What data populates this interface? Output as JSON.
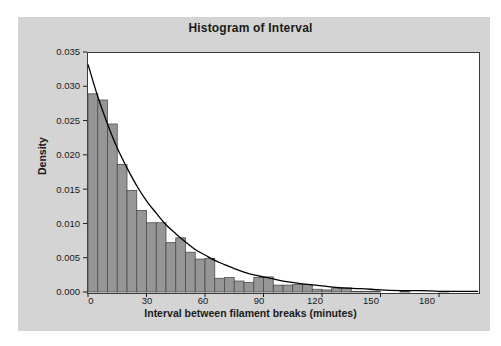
{
  "chart_data": {
    "type": "bar",
    "title": "Histogram of Interval",
    "xlabel": "Interval between filament breaks (minutes)",
    "ylabel": "Density",
    "xlim": [
      0,
      200
    ],
    "ylim": [
      0,
      0.035
    ],
    "grid": false,
    "legend": null,
    "bin_width": 5,
    "bar_color": "#969696",
    "bar_edge_color": "#4d4d4d",
    "curve_color": "#000000",
    "panel_color": "#d4d4d4",
    "plot_background": "#ffffff",
    "xticks": [
      0,
      30,
      60,
      90,
      120,
      150,
      180
    ],
    "xtick_labels": [
      "0",
      "30",
      "60",
      "90",
      "120",
      "150",
      "180"
    ],
    "yticks": [
      0.0,
      0.005,
      0.01,
      0.015,
      0.02,
      0.025,
      0.03,
      0.035
    ],
    "ytick_labels": [
      "0.000",
      "0.005",
      "0.010",
      "0.015",
      "0.020",
      "0.025",
      "0.030",
      "0.035"
    ],
    "bin_starts": [
      0,
      5,
      10,
      15,
      20,
      25,
      30,
      35,
      40,
      45,
      50,
      55,
      60,
      65,
      70,
      75,
      80,
      85,
      90,
      95,
      100,
      105,
      110,
      115,
      120,
      125,
      130,
      135,
      140,
      145,
      150,
      155,
      160,
      165,
      170,
      175,
      180,
      185,
      190,
      195
    ],
    "values": [
      0.0289,
      0.028,
      0.0245,
      0.0186,
      0.0148,
      0.0119,
      0.0101,
      0.0101,
      0.0072,
      0.0079,
      0.0058,
      0.0048,
      0.0049,
      0.002,
      0.0021,
      0.0016,
      0.0014,
      0.0021,
      0.0022,
      0.001,
      0.001,
      0.0011,
      0.0011,
      0.0004,
      0.0003,
      0.0006,
      0.0006,
      0.0001,
      0.0001,
      0.0001,
      0.0,
      0.0,
      0.0001,
      0.0,
      0.0,
      0.0,
      0.0001,
      0.0,
      0.0,
      0.0
    ],
    "overlay_curve": {
      "name": "exponential density fit",
      "x": [
        0,
        5,
        10,
        15,
        20,
        25,
        30,
        35,
        40,
        45,
        50,
        55,
        60,
        65,
        70,
        75,
        80,
        85,
        90,
        95,
        100,
        110,
        120,
        130,
        140,
        150,
        160,
        170,
        180,
        190,
        200
      ],
      "y": [
        0.0332,
        0.0285,
        0.0245,
        0.021,
        0.0181,
        0.0155,
        0.0133,
        0.0115,
        0.0098,
        0.0085,
        0.0073,
        0.0062,
        0.0054,
        0.0046,
        0.004,
        0.0034,
        0.0029,
        0.0025,
        0.0022,
        0.0019,
        0.0016,
        0.0012,
        0.0009,
        0.0006,
        0.0005,
        0.0003,
        0.0002,
        0.0002,
        0.0001,
        0.0001,
        0.0001
      ]
    }
  }
}
